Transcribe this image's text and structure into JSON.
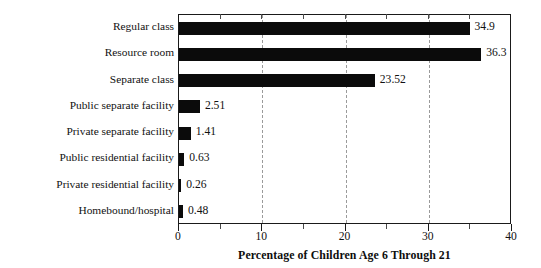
{
  "chart_data": {
    "type": "bar",
    "orientation": "horizontal",
    "title": "",
    "xlabel": "Percentage of Children Age 6 Through 21",
    "ylabel": "",
    "xlim": [
      0,
      40
    ],
    "xticks": [
      0,
      10,
      20,
      30,
      40
    ],
    "xtick_labels": [
      "0",
      "10",
      "20",
      "30",
      "40"
    ],
    "minor_xticks": [
      5,
      15,
      25,
      35
    ],
    "gridlines": [
      10,
      20,
      30
    ],
    "grid": true,
    "grid_style": "dashed",
    "legend": null,
    "bar_color": "#0b0b0b",
    "categories": [
      "Regular class",
      "Resource room",
      "Separate class",
      "Public separate facility",
      "Private separate facility",
      "Public residential facility",
      "Private residential facility",
      "Homebound/hospital"
    ],
    "values": [
      34.9,
      36.3,
      23.52,
      2.51,
      1.41,
      0.63,
      0.26,
      0.48
    ],
    "value_labels": [
      "34.9",
      "36.3",
      "23.52",
      "2.51",
      "1.41",
      "0.63",
      "0.26",
      "0.48"
    ]
  },
  "colors": {
    "bar": "#0b0b0b",
    "axis": "#1a1a1a",
    "grid": "#9a9a9a",
    "text": "#111111",
    "background": "#ffffff"
  }
}
